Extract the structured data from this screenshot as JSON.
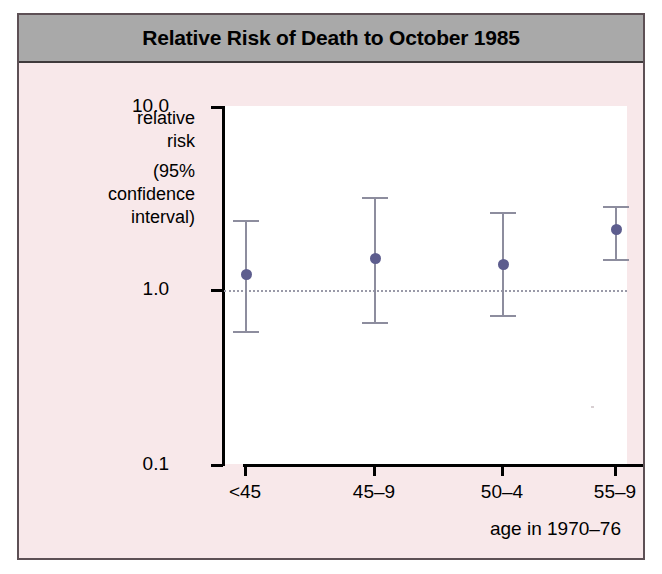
{
  "figure": {
    "title": "Relative Risk of Death to October 1985",
    "panel_color": "#f8e8ea",
    "title_bar_color": "#a9a9a9",
    "plot_background": "#ffffff",
    "border_color": "#5d5055"
  },
  "chart_data": {
    "type": "scatter",
    "title": "Relative Risk of Death to October 1985",
    "xlabel": "age in 1970–76",
    "ylabel": "relative risk (95% confidence interval)",
    "ylabel_lines": [
      "relative",
      "risk",
      "(95%",
      "confidence",
      "interval)"
    ],
    "categories": [
      "<45",
      "45–9",
      "50–4",
      "55–9"
    ],
    "yscale": "log",
    "ylim": [
      0.1,
      10.0
    ],
    "ytick_labels": [
      "10.0",
      "1.0",
      "0.1"
    ],
    "ytick_values": [
      10.0,
      1.0,
      0.1
    ],
    "grid": false,
    "reference_line": {
      "value": 1.0,
      "style": "dotted",
      "color": "#9a9aa8"
    },
    "marker_color": "#5d5d8e",
    "errorbar_color": "#8d8d9e",
    "legend": "none",
    "points": [
      {
        "category": "<45",
        "value": 1.15,
        "ci_low": 0.55,
        "ci_high": 2.3
      },
      {
        "category": "45–9",
        "value": 1.4,
        "ci_low": 0.62,
        "ci_high": 3.1
      },
      {
        "category": "50–4",
        "value": 1.3,
        "ci_low": 0.68,
        "ci_high": 2.55
      },
      {
        "category": "55–9",
        "value": 2.05,
        "ci_low": 1.4,
        "ci_high": 2.75
      }
    ]
  }
}
